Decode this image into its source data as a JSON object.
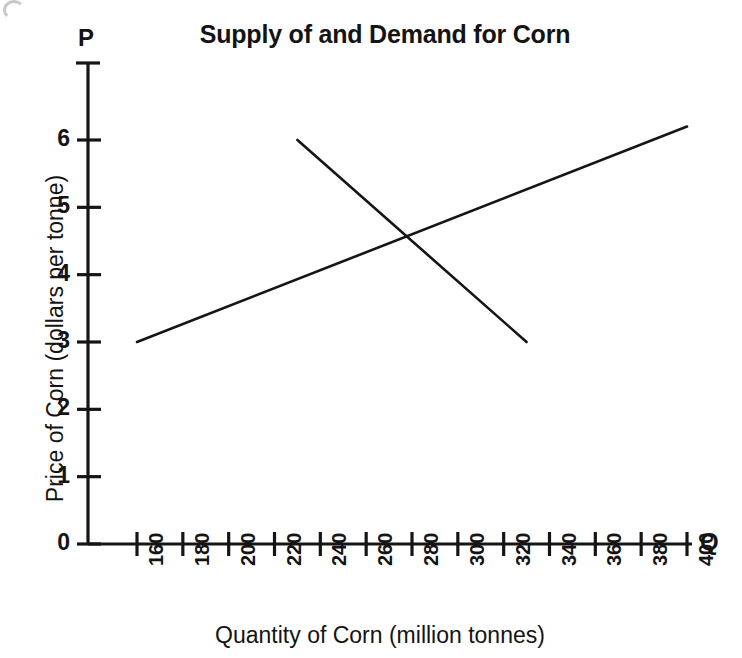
{
  "chart_data": {
    "type": "line",
    "title": "Supply of and Demand for Corn",
    "xlabel": "Quantity of Corn (million tonnes)",
    "ylabel": "Price of Corn (dollars per tonne)",
    "x_axis_symbol": "Q",
    "y_axis_symbol": "P",
    "xlim": [
      140,
      410
    ],
    "ylim": [
      0,
      6.7
    ],
    "grid": false,
    "legend": "none",
    "x_ticks": [
      160,
      180,
      200,
      220,
      240,
      260,
      280,
      300,
      320,
      340,
      360,
      380,
      400
    ],
    "x_tick_labels": [
      "160",
      "180",
      "200",
      "220",
      "240",
      "260",
      "280",
      "300",
      "320",
      "340",
      "360",
      "380",
      "400"
    ],
    "y_ticks": [
      0,
      1,
      2,
      3,
      4,
      5,
      6
    ],
    "y_tick_labels": [
      "0",
      "1",
      "2",
      "3",
      "4",
      "5",
      "6"
    ],
    "series": [
      {
        "name": "Supply",
        "slope": "upward",
        "points": [
          {
            "x": 160,
            "y": 3.0
          },
          {
            "x": 400,
            "y": 6.2
          }
        ]
      },
      {
        "name": "Demand",
        "slope": "downward",
        "points": [
          {
            "x": 230,
            "y": 6.0
          },
          {
            "x": 330,
            "y": 3.0
          }
        ]
      }
    ],
    "equilibrium": {
      "x": 280,
      "y": 4.6
    },
    "line_color": "#151515",
    "background_color": "#ffffff"
  }
}
